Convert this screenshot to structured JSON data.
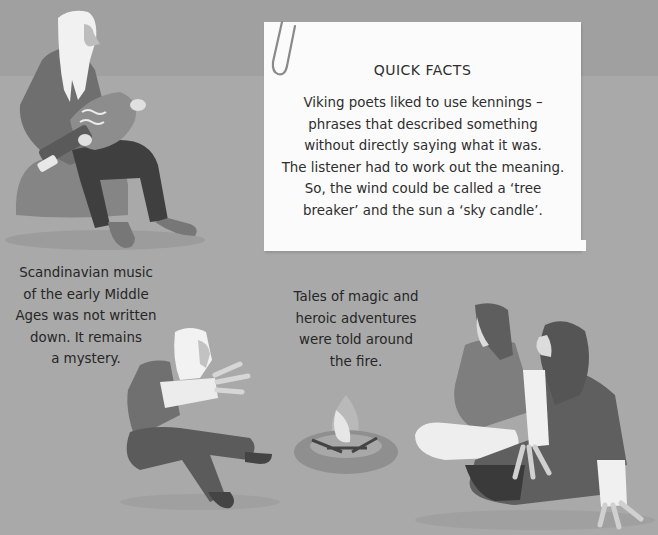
{
  "scene": {
    "background_color": "#a6a6a6",
    "note_color": "#fbfbfb",
    "text_color": "#2b2b2b"
  },
  "quick_facts": {
    "title": "QUICK FACTS",
    "lines": [
      "Viking poets liked to use kennings –",
      "phrases that described something",
      "without directly saying what it was.",
      "The listener had to work out the meaning.",
      "So, the wind could be called a ‘tree",
      "breaker’ and the sun a ‘sky candle’."
    ]
  },
  "captions": {
    "music": {
      "lines": [
        "Scandinavian music",
        "of the early Middle",
        "Ages was not written",
        "down. It remains",
        "a mystery."
      ]
    },
    "tales": {
      "lines": [
        "Tales of magic and",
        "heroic adventures",
        "were told around",
        "the fire."
      ]
    }
  },
  "illustrations": {
    "musician": "seated bearded man playing hurdy-gurdy",
    "storyteller": "kneeling man gesturing toward fire",
    "campfire": "stone ring campfire",
    "listeners": "two long-haired listeners seated on the ground"
  }
}
